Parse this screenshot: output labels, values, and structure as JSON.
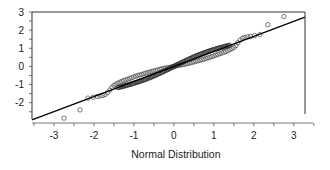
{
  "chart_data": {
    "type": "scatter",
    "subtype": "normal-qq-plot",
    "title": "",
    "xlabel": "Normal Distribution",
    "ylabel": "",
    "xlim": [
      -3.55,
      3.28
    ],
    "ylim": [
      -2.9,
      3.0
    ],
    "x_ticks": [
      -3,
      -2,
      -1,
      0,
      1,
      2,
      3
    ],
    "x_tick_labels": [
      "-3",
      "-2",
      "-1",
      "0",
      "1",
      "2",
      "3"
    ],
    "x_minor_step": 0.5,
    "y_ticks": [
      -2,
      -1,
      0,
      1,
      2,
      3
    ],
    "y_tick_labels": [
      "-2",
      "-1",
      "0",
      "1",
      "2",
      "3"
    ],
    "y_minor_step": 0.5,
    "grid": false,
    "legend": null,
    "reference_line": {
      "intercept": 0.0,
      "slope": 0.83,
      "color": "#000000"
    },
    "marker": {
      "shape": "open-circle",
      "color": "#555555",
      "radius": 2.2
    },
    "series": [
      {
        "name": "sample quantiles",
        "x": [
          -2.75,
          -2.35,
          -2.15,
          -2.02,
          -1.92,
          -1.85,
          -1.78,
          -1.72,
          -1.66,
          -1.6,
          -1.55,
          -1.5,
          -1.45,
          -1.4,
          -1.35,
          -1.3,
          -1.25,
          -1.2,
          -1.15,
          -1.1,
          -1.05,
          -1.0,
          -0.95,
          -0.9,
          -0.85,
          -0.8,
          -0.75,
          -0.7,
          -0.65,
          -0.6,
          -0.55,
          -0.5,
          -0.45,
          -0.4,
          -0.35,
          -0.3,
          -0.25,
          -0.2,
          -0.15,
          -0.1,
          -0.05,
          0.0,
          0.05,
          0.1,
          0.15,
          0.2,
          0.25,
          0.3,
          0.35,
          0.4,
          0.45,
          0.5,
          0.55,
          0.6,
          0.65,
          0.7,
          0.75,
          0.8,
          0.85,
          0.9,
          0.95,
          1.0,
          1.05,
          1.1,
          1.15,
          1.2,
          1.25,
          1.3,
          1.35,
          1.4,
          1.45,
          1.5,
          1.55,
          1.6,
          1.66,
          1.72,
          1.78,
          1.85,
          1.92,
          2.02,
          2.15,
          2.35,
          2.75
        ],
        "y": [
          -2.85,
          -2.4,
          -1.75,
          -1.7,
          -1.66,
          -1.63,
          -1.6,
          -1.55,
          -1.45,
          -1.3,
          -1.15,
          -1.05,
          -0.98,
          -0.92,
          -0.87,
          -0.82,
          -0.78,
          -0.74,
          -0.7,
          -0.66,
          -0.62,
          -0.58,
          -0.54,
          -0.5,
          -0.47,
          -0.44,
          -0.4,
          -0.37,
          -0.34,
          -0.31,
          -0.28,
          -0.25,
          -0.22,
          -0.19,
          -0.16,
          -0.13,
          -0.11,
          -0.09,
          -0.07,
          -0.05,
          -0.03,
          0.0,
          0.03,
          0.05,
          0.07,
          0.09,
          0.11,
          0.13,
          0.16,
          0.19,
          0.22,
          0.25,
          0.28,
          0.31,
          0.34,
          0.37,
          0.4,
          0.44,
          0.47,
          0.5,
          0.54,
          0.58,
          0.62,
          0.66,
          0.7,
          0.74,
          0.78,
          0.82,
          0.87,
          0.92,
          0.98,
          1.05,
          1.15,
          1.3,
          1.45,
          1.55,
          1.6,
          1.63,
          1.66,
          1.7,
          1.75,
          2.3,
          2.75
        ]
      }
    ]
  },
  "labels": {
    "xlabel": "Normal Distribution"
  }
}
